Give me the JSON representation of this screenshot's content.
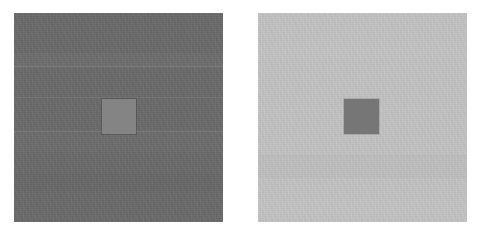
{
  "figure": {
    "name": "simultaneous-contrast-illusion",
    "type": "two-panel-grayscale-stimulus",
    "canvas": {
      "width": 478,
      "height": 238,
      "background": "#ffffff"
    }
  },
  "panels": [
    {
      "id": "left",
      "role": "dark-surround",
      "surround_color": "#6b6b6b",
      "surround_luminance_label": "dark",
      "x": 14,
      "y": 13,
      "width": 209,
      "height": 209,
      "bands": [
        {
          "y": 40,
          "height": 14,
          "color": "rgba(255,255,255,0.022)"
        },
        {
          "y": 53,
          "height": 1,
          "color": "rgba(255,255,255,0.10)"
        },
        {
          "y": 84,
          "height": 1,
          "color": "rgba(255,255,255,0.055)"
        },
        {
          "y": 118,
          "height": 1,
          "color": "rgba(255,255,255,0.10)"
        },
        {
          "y": 119,
          "height": 20,
          "color": "rgba(255,255,255,0.016)"
        },
        {
          "y": 160,
          "height": 18,
          "color": "rgba(0,0,0,0.014)"
        }
      ],
      "patch": {
        "id": "left-test-patch",
        "color": "#848484",
        "x": 102,
        "y": 99,
        "width": 34,
        "height": 35,
        "border_color": "rgba(0,0,0,0.16)",
        "appears": "lighter"
      }
    },
    {
      "id": "right",
      "role": "light-surround",
      "surround_color": "#c3c3c3",
      "surround_luminance_label": "light",
      "x": 258,
      "y": 13,
      "width": 209,
      "height": 209,
      "bands": [
        {
          "y": 30,
          "height": 16,
          "color": "rgba(255,255,255,0.030)"
        },
        {
          "y": 96,
          "height": 1,
          "color": "rgba(255,255,255,0.055)"
        },
        {
          "y": 142,
          "height": 1,
          "color": "rgba(0,0,0,0.035)"
        },
        {
          "y": 143,
          "height": 22,
          "color": "rgba(0,0,0,0.016)"
        },
        {
          "y": 186,
          "height": 16,
          "color": "rgba(255,255,255,0.025)"
        }
      ],
      "patch": {
        "id": "right-test-patch",
        "color": "#767676",
        "x": 344,
        "y": 99,
        "width": 35,
        "height": 35,
        "border_color": "rgba(0,0,0,0.10)",
        "appears": "darker"
      }
    }
  ]
}
